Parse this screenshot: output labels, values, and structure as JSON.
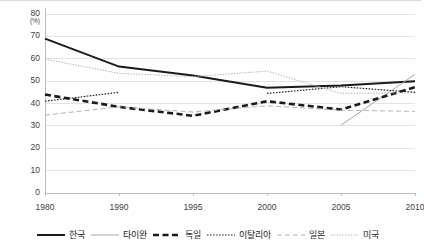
{
  "chart_data": {
    "type": "line",
    "title": "",
    "subtitle": "",
    "xlabel": "",
    "ylabel": "",
    "y_unit": "(%)",
    "categories": [
      "1980",
      "1990",
      "1995",
      "2000",
      "2005",
      "2010"
    ],
    "x": [
      1980,
      1990,
      1995,
      2000,
      2005,
      2010
    ],
    "ylim": [
      0,
      80
    ],
    "y_ticks": [
      "0",
      "10",
      "20",
      "30",
      "40",
      "50",
      "60",
      "70",
      "80"
    ],
    "grid": true,
    "legend_position": "bottom",
    "series": [
      {
        "name": "한국",
        "style": "solid-thick",
        "color": "#1a1a1a",
        "values": [
          69.0,
          56.5,
          52.5,
          47.0,
          48.0,
          50.0
        ]
      },
      {
        "name": "타이완",
        "style": "solid-thin",
        "color": "#a6a6a6",
        "values": [
          null,
          null,
          null,
          null,
          30.3,
          53.0
        ]
      },
      {
        "name": "독일",
        "style": "dashed-thick",
        "color": "#1a1a1a",
        "values": [
          44.0,
          38.5,
          34.5,
          41.0,
          37.3,
          47.3
        ]
      },
      {
        "name": "이탈리아",
        "style": "dotted",
        "color": "#262626",
        "values": [
          41.0,
          45.0,
          null,
          44.5,
          47.5,
          45.0
        ]
      },
      {
        "name": "일본",
        "style": "dashed-thin",
        "color": "#b3b3b3",
        "values": [
          34.8,
          38.5,
          36.2,
          39.0,
          37.0,
          36.5
        ]
      },
      {
        "name": "미국",
        "style": "dotted-thin",
        "color": "#b3b3b3",
        "values": [
          59.8,
          53.5,
          52.0,
          54.5,
          44.5,
          44.8
        ]
      }
    ]
  },
  "legend": {
    "items": [
      {
        "label": "한국"
      },
      {
        "label": "타이완"
      },
      {
        "label": "독일"
      },
      {
        "label": "이탈리아"
      },
      {
        "label": "일본"
      },
      {
        "label": "미국"
      }
    ]
  }
}
